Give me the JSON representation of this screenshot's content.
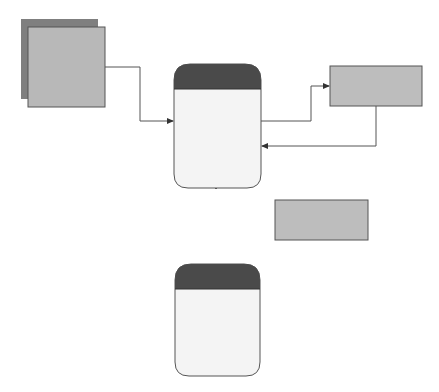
{
  "external_entity": {
    "label": "External entity"
  },
  "processes": [
    {
      "number": "1",
      "label": "Check course availability"
    },
    {
      "number": "2",
      "label": "Check applicant qualification"
    }
  ],
  "data_stores": [
    {
      "label": "Courses"
    },
    {
      "label": "Applications"
    }
  ],
  "flows": [
    {
      "label": "Application"
    },
    {
      "label": "Inquiry"
    },
    {
      "label": "Reply"
    },
    {
      "label": "Inquiry"
    },
    {
      "label": "Reply"
    },
    {
      "label": "Accept/decline enrollment"
    }
  ],
  "colors": {
    "process_header": "#4a4a4a",
    "store_fill": "#bdbdbd",
    "entity_fill": "#b8b8b8",
    "entity_shadow": "#7f7f7f",
    "line": "#555555"
  }
}
